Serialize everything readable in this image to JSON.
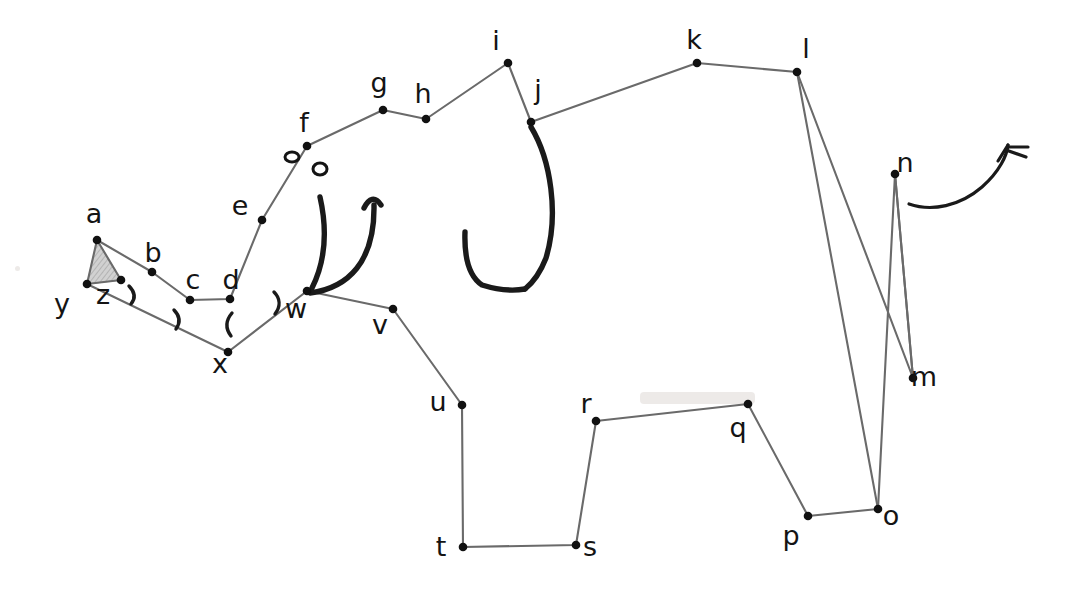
{
  "figure": {
    "kind": "hand-drawn-line-figure",
    "background_color": "#ffffff",
    "stroke_color": "#6a6a6a",
    "bold_stroke_color": "#1a1a1a",
    "dot_color": "#111111",
    "label_color": "#141414",
    "canvas": {
      "width": 1067,
      "height": 599
    }
  },
  "vertices": [
    {
      "id": "a",
      "label": "a",
      "x": 97,
      "y": 240,
      "lx": 94,
      "ly": 223
    },
    {
      "id": "b",
      "label": "b",
      "x": 152,
      "y": 272,
      "lx": 153,
      "ly": 262
    },
    {
      "id": "c",
      "label": "c",
      "x": 190,
      "y": 300,
      "lx": 193,
      "ly": 289
    },
    {
      "id": "d",
      "label": "d",
      "x": 230,
      "y": 299,
      "lx": 231,
      "ly": 289
    },
    {
      "id": "e",
      "label": "e",
      "x": 262,
      "y": 220,
      "lx": 240,
      "ly": 215
    },
    {
      "id": "f",
      "label": "f",
      "x": 307,
      "y": 146,
      "lx": 304,
      "ly": 132
    },
    {
      "id": "g",
      "label": "g",
      "x": 383,
      "y": 110,
      "lx": 379,
      "ly": 92
    },
    {
      "id": "h",
      "label": "h",
      "x": 426,
      "y": 119,
      "lx": 423,
      "ly": 103
    },
    {
      "id": "i",
      "label": "i",
      "x": 508,
      "y": 63,
      "lx": 496,
      "ly": 50
    },
    {
      "id": "j",
      "label": "j",
      "x": 531,
      "y": 122,
      "lx": 538,
      "ly": 99
    },
    {
      "id": "k",
      "label": "k",
      "x": 697,
      "y": 63,
      "lx": 694,
      "ly": 49
    },
    {
      "id": "l",
      "label": "l",
      "x": 797,
      "y": 72,
      "lx": 806,
      "ly": 58
    },
    {
      "id": "m",
      "label": "m",
      "x": 913,
      "y": 378,
      "lx": 924,
      "ly": 386
    },
    {
      "id": "n",
      "label": "n",
      "x": 895,
      "y": 174,
      "lx": 905,
      "ly": 172
    },
    {
      "id": "o",
      "label": "o",
      "x": 878,
      "y": 509,
      "lx": 891,
      "ly": 525
    },
    {
      "id": "p",
      "label": "p",
      "x": 808,
      "y": 516,
      "lx": 791,
      "ly": 545
    },
    {
      "id": "q",
      "label": "q",
      "x": 748,
      "y": 404,
      "lx": 738,
      "ly": 437
    },
    {
      "id": "r",
      "label": "r",
      "x": 596,
      "y": 421,
      "lx": 586,
      "ly": 413
    },
    {
      "id": "s",
      "label": "s",
      "x": 576,
      "y": 545,
      "lx": 590,
      "ly": 556
    },
    {
      "id": "t",
      "label": "t",
      "x": 463,
      "y": 547,
      "lx": 441,
      "ly": 556
    },
    {
      "id": "u",
      "label": "u",
      "x": 462,
      "y": 405,
      "lx": 438,
      "ly": 411
    },
    {
      "id": "v",
      "label": "v",
      "x": 393,
      "y": 309,
      "lx": 380,
      "ly": 334
    },
    {
      "id": "w",
      "label": "w",
      "x": 307,
      "y": 291,
      "lx": 296,
      "ly": 318
    },
    {
      "id": "x",
      "label": "x",
      "x": 228,
      "y": 352,
      "lx": 220,
      "ly": 373
    },
    {
      "id": "y",
      "label": "y",
      "x": 87,
      "y": 284,
      "lx": 62,
      "ly": 313
    },
    {
      "id": "z",
      "label": "z",
      "x": 121,
      "y": 280,
      "lx": 103,
      "ly": 304
    }
  ],
  "outline_path": [
    "a",
    "b",
    "c",
    "d",
    "e",
    "f",
    "g",
    "h",
    "i",
    "j",
    "k",
    "l",
    "m",
    "n",
    "o",
    "p",
    "q",
    "r",
    "s",
    "t",
    "u",
    "v",
    "w",
    "x",
    "y"
  ],
  "closing_edges": [
    {
      "from": "y",
      "to": "a"
    },
    {
      "from": "y",
      "to": "z"
    },
    {
      "from": "z",
      "to": "a"
    },
    {
      "from": "n",
      "to": "m"
    },
    {
      "from": "l",
      "to": "o"
    }
  ],
  "shading": {
    "name": "tusk-shading",
    "region": [
      "a",
      "y",
      "z"
    ],
    "description": "pencil hatched triangular patch at the tusk"
  },
  "eyes": [
    {
      "name": "eye-left",
      "x": 292,
      "y": 157,
      "rx": 7,
      "ry": 5
    },
    {
      "name": "eye-right",
      "x": 320,
      "y": 169,
      "rx": 7,
      "ry": 6
    }
  ],
  "bold_strokes": [
    {
      "name": "ear-front-arc",
      "d": "M 320 197 C 327 228 327 258 312 288"
    },
    {
      "name": "ear-back-arc",
      "d": "M 310 293 C 348 288 375 262 374 205"
    },
    {
      "name": "ear-tip-hook",
      "d": "M 364 208 C 369 198 375 196 381 205"
    },
    {
      "name": "body-ear-big",
      "d": "M 531 127 C 551 160 559 215 546 258 C 539 276 530 285 525 289"
    },
    {
      "name": "body-ear-lower",
      "d": "M 465 232 C 464 260 470 277 482 285 C 498 290 514 291 525 289"
    },
    {
      "name": "tail-curve",
      "d": "M 909 204 C 932 212 960 206 982 187 C 1000 171 1007 155 1008 145"
    },
    {
      "name": "tail-tuft-1",
      "d": "M 1008 145 L 998 161"
    },
    {
      "name": "tail-tuft-2",
      "d": "M 1006 150 L 1026 157"
    },
    {
      "name": "tail-tuft-3",
      "d": "M 1009 147 L 1028 147"
    }
  ],
  "tick_marks": [
    {
      "name": "tick-1",
      "d": "M 129 286 C 135 292 136 298 131 304"
    },
    {
      "name": "tick-2",
      "d": "M 174 310 C 180 316 181 322 176 329"
    },
    {
      "name": "tick-3",
      "d": "M 232 313 C 226 320 225 328 231 336"
    },
    {
      "name": "tick-4",
      "d": "M 274 292 C 280 298 281 306 275 314"
    }
  ],
  "smudges": [
    {
      "name": "smudge-leg-top",
      "x": 640,
      "y": 392,
      "w": 115,
      "h": 12
    },
    {
      "name": "smudge-paper",
      "x": 15,
      "y": 266,
      "w": 5,
      "h": 5
    }
  ]
}
